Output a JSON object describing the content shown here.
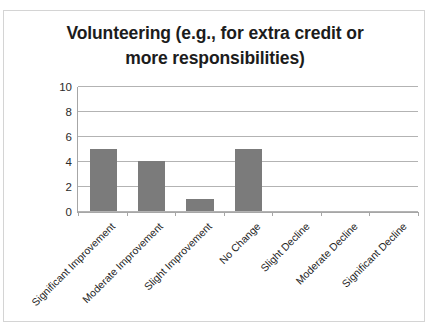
{
  "chart_data": {
    "type": "bar",
    "title": "Volunteering (e.g., for extra credit or more responsibilities)",
    "title_lines": [
      "Volunteering (e.g., for extra credit or",
      "more responsibilities)"
    ],
    "categories": [
      "Significant Improvement",
      "Moderate Improvement",
      "Slight Improvement",
      "No Change",
      "Slight Decline",
      "Moderate Decline",
      "Significant Decline"
    ],
    "values": [
      5,
      4,
      1,
      5,
      0,
      0,
      0
    ],
    "xlabel": "",
    "ylabel": "",
    "ylim": [
      0,
      10
    ],
    "yticks": [
      0,
      2,
      4,
      6,
      8,
      10
    ],
    "ytick_labels": [
      "0",
      "2",
      "4",
      "6",
      "8",
      "10"
    ],
    "grid": true,
    "legend": false,
    "bar_color": "#7b7b7b",
    "gridline_color": "#b3b3b3",
    "axis_color": "#a6a6a6",
    "frame_color": "#d4d4d4",
    "text_color": "#1c1c1c",
    "label_rotation_degrees": -45
  }
}
